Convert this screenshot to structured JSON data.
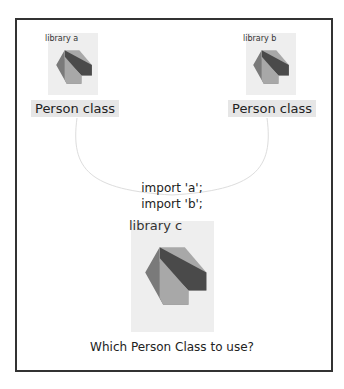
{
  "library_a": {
    "label": "library a",
    "class_label": "Person class"
  },
  "library_b": {
    "label": "library b",
    "class_label": "Person class"
  },
  "imports": [
    "import 'a';",
    "import 'b';"
  ],
  "library_c": {
    "label": "library c"
  },
  "question": "Which Person Class to use?",
  "colors": {
    "dark": "#4a4a4a",
    "mid": "#7a7a7a",
    "light": "#a8a8a8",
    "box_bg": "#eeeeee",
    "frame": "#333333"
  }
}
